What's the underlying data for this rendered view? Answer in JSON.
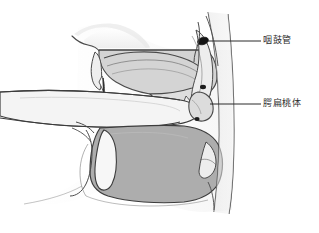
{
  "figure": {
    "type": "medical-illustration",
    "background_color": "#ffffff",
    "line_color": "#3a3a3a",
    "fills": {
      "skin_light": "#f2f2f2",
      "cavity_light": "#e2e2e2",
      "palate_gray": "#d8d8d8",
      "tongue_gray": "#adadad",
      "pharynx_gray": "#c9c9c9",
      "marker_black": "#141414"
    }
  },
  "labels": [
    {
      "id": "eustachian-tube",
      "text": "咽鼓管",
      "leader": {
        "x1": 208,
        "y1": 41,
        "x2": 261,
        "y2": 41
      },
      "target": {
        "x": 206,
        "y": 41
      }
    },
    {
      "id": "palatine-tonsil",
      "text": "腭扁桃体",
      "leader": {
        "x1": 210,
        "y1": 104,
        "x2": 261,
        "y2": 104
      },
      "target": {
        "x": 209,
        "y": 104
      }
    }
  ]
}
